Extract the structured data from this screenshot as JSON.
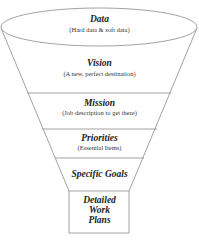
{
  "diagram": {
    "type": "funnel",
    "stages": [
      {
        "title": "Data",
        "subtitle": "(Hard data & soft data)"
      },
      {
        "title": "Vision",
        "subtitle": "(A new, perfect destination)"
      },
      {
        "title": "Mission",
        "subtitle": "(Job description to get there)"
      },
      {
        "title": "Priorities",
        "subtitle": "(Essential Items)"
      },
      {
        "title": "Specific Goals"
      },
      {
        "title_lines": [
          "Detailed",
          "Work",
          "Plans"
        ]
      }
    ],
    "colors": {
      "line": "#8a8a8a",
      "text": "#222222",
      "background": "#ffffff"
    }
  }
}
